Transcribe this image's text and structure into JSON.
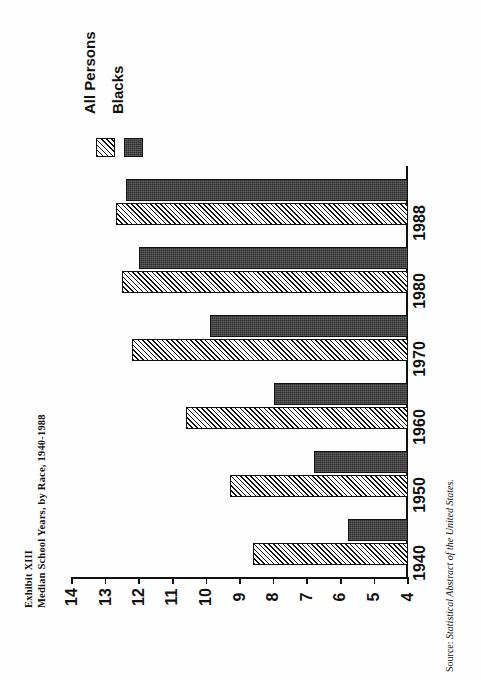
{
  "document": {
    "exhibit_label": "Exhibit XIII",
    "title": "Median School Years, by Race, 1940-1988",
    "source_label": "Source:",
    "source_text": "Statistical Abstract of the United States."
  },
  "legend": {
    "items": [
      {
        "label": "All Persons",
        "swatch": "hatched-diagonal",
        "color": "#ffffff"
      },
      {
        "label": "Blacks",
        "swatch": "solid-dark",
        "color": "#2e2e2e"
      }
    ]
  },
  "axis": {
    "value_ticks": [
      "14",
      "13",
      "12",
      "11",
      "10",
      "9",
      "8",
      "7",
      "6",
      "5",
      "4"
    ],
    "category_ticks": [
      "1988",
      "1980",
      "1970",
      "1960",
      "1950",
      "1940"
    ]
  },
  "chart_data": {
    "type": "bar",
    "orientation": "horizontal",
    "rotated_page": true,
    "title": "Median School Years, by Race, 1940-1988",
    "subtitle": "Exhibit XIII",
    "xlabel": "",
    "ylabel": "Median School Years",
    "categories": [
      "1940",
      "1950",
      "1960",
      "1970",
      "1980",
      "1988"
    ],
    "series": [
      {
        "name": "All Persons",
        "values": [
          8.6,
          9.3,
          10.6,
          12.2,
          12.5,
          12.7
        ]
      },
      {
        "name": "Blacks",
        "values": [
          5.8,
          6.8,
          8.0,
          9.9,
          12.0,
          12.4
        ]
      }
    ],
    "ylim": [
      4,
      14
    ],
    "value_axis_range": [
      4,
      14
    ],
    "value_axis_ticks": [
      4,
      5,
      6,
      7,
      8,
      9,
      10,
      11,
      12,
      13,
      14
    ],
    "grid": false,
    "legend_position": "top-left",
    "source": "Statistical Abstract of the United States."
  }
}
